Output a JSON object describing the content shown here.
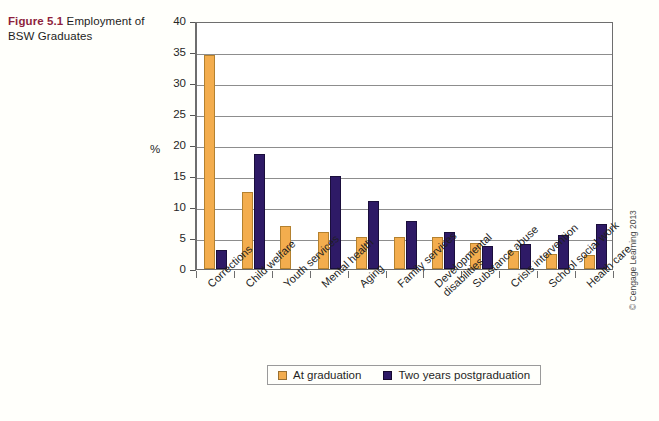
{
  "caption": {
    "figure_number": "Figure 5.1",
    "title": " Employment of BSW Graduates"
  },
  "copyright": "© Cengage Learning 2013",
  "legend": {
    "items": [
      {
        "label": "At graduation",
        "color": "#f3ad4e"
      },
      {
        "label": "Two years postgraduation",
        "color": "#2e1a66"
      }
    ]
  },
  "chart_data": {
    "type": "bar",
    "title": "Figure 5.1 Employment of BSW Graduates",
    "xlabel": "",
    "ylabel": "%",
    "ylim": [
      0,
      40
    ],
    "yticks": [
      0,
      5,
      10,
      15,
      20,
      25,
      30,
      35,
      40
    ],
    "ytick_labels": [
      "0",
      "5",
      "10",
      "15",
      "20",
      "25",
      "30",
      "35",
      "40"
    ],
    "grid": true,
    "legend_position": "bottom",
    "categories": [
      "Corrections",
      "Child welfare",
      "Youth services",
      "Mental health",
      "Aging",
      "Family services",
      "Developmental disabilities",
      "Substance abuse",
      "Crisis intervention",
      "School social work",
      "Health care"
    ],
    "series": [
      {
        "name": "At graduation",
        "color": "#f3ad4e",
        "values": [
          34.5,
          12.5,
          6.9,
          5.9,
          5.2,
          5.1,
          5.1,
          4.2,
          2.9,
          2.4,
          2.2
        ]
      },
      {
        "name": "Two years postgraduation",
        "color": "#2e1a66",
        "values": [
          3.0,
          18.6,
          0,
          15.0,
          11.0,
          7.7,
          5.9,
          3.7,
          4.1,
          5.5,
          7.2
        ]
      }
    ]
  }
}
